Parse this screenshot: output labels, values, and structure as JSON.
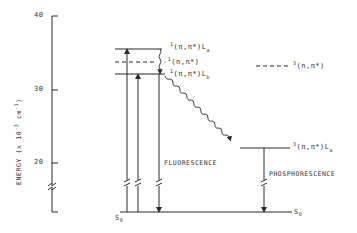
{
  "axis": {
    "label": "ENERGY (x 10",
    "label_exp": "-3",
    "label_unit": " cm",
    "label_unit_exp": "-1",
    "label_close": ")",
    "ticks": [
      {
        "value": "40",
        "y": 16
      },
      {
        "value": "30",
        "y": 90
      },
      {
        "value": "20",
        "y": 163
      }
    ],
    "has_break": true
  },
  "levels": {
    "singlet_La": {
      "mult": "1",
      "state": "(π,π*)L",
      "sub": "a"
    },
    "singlet_npi": {
      "mult": "1",
      "state": "(n,π*)"
    },
    "singlet_Lb": {
      "mult": "1",
      "state": "(π,π*)L",
      "sub": "b"
    },
    "triplet_npi": {
      "mult": "3",
      "state": "(n,π*)"
    },
    "triplet_La": {
      "mult": "3",
      "state": "(π,π*)L",
      "sub": "a"
    },
    "ground_left": {
      "state": "S",
      "sub": "0"
    },
    "ground_right": {
      "state": "S",
      "sub": "0"
    }
  },
  "processes": {
    "fluorescence": "FLUORESCENCE",
    "phosphorescence": "PHOSPHORESCENCE"
  },
  "colors": {
    "line": "#2a2a2a",
    "background": "#ffffff"
  }
}
